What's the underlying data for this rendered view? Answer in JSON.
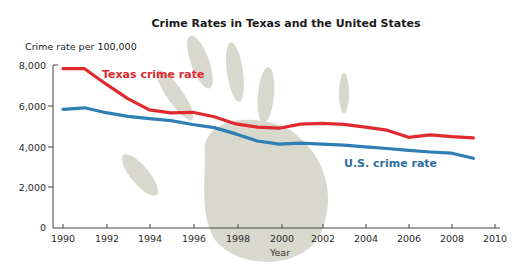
{
  "chart_data": {
    "type": "line",
    "title": "Crime Rates in Texas and the United States",
    "xlabel": "Year",
    "ylabel": "Crime rate per 100,000",
    "xlim": [
      1990,
      2010
    ],
    "ylim": [
      0,
      8000
    ],
    "grid": false,
    "legend_position": "inline labels",
    "x_ticks": [
      1990,
      1992,
      1994,
      1996,
      1998,
      2000,
      2002,
      2004,
      2006,
      2008,
      2010
    ],
    "x_tick_labels": [
      "1990",
      "1992",
      "1994",
      "1996",
      "1998",
      "2000",
      "2002",
      "2004",
      "2006",
      "2008",
      "2010"
    ],
    "y_ticks": [
      0,
      2000,
      4000,
      6000,
      8000
    ],
    "y_tick_labels": [
      "0",
      "2,000",
      "4,000",
      "6,000",
      "8,000"
    ],
    "x": [
      1990,
      1991,
      1992,
      1993,
      1994,
      1995,
      1996,
      1997,
      1998,
      1999,
      2000,
      2001,
      2002,
      2003,
      2004,
      2005,
      2006,
      2007,
      2008,
      2009
    ],
    "series": [
      {
        "name": "Texas crime rate",
        "color": "#e02a2f",
        "values": [
          7820,
          7820,
          7060,
          6350,
          5800,
          5650,
          5680,
          5460,
          5110,
          4950,
          4900,
          5100,
          5140,
          5090,
          4950,
          4800,
          4450,
          4570,
          4480,
          4420
        ]
      },
      {
        "name": "U.S. crime rate",
        "color": "#2f7fb5",
        "values": [
          5820,
          5900,
          5660,
          5480,
          5370,
          5270,
          5080,
          4930,
          4620,
          4270,
          4120,
          4160,
          4120,
          4070,
          3980,
          3900,
          3810,
          3730,
          3670,
          3420
        ]
      }
    ],
    "annotations": [
      {
        "text": "Texas crime rate",
        "color": "#e02a2f"
      },
      {
        "text": "U.S. crime rate",
        "color": "#2f6e9e"
      }
    ]
  }
}
